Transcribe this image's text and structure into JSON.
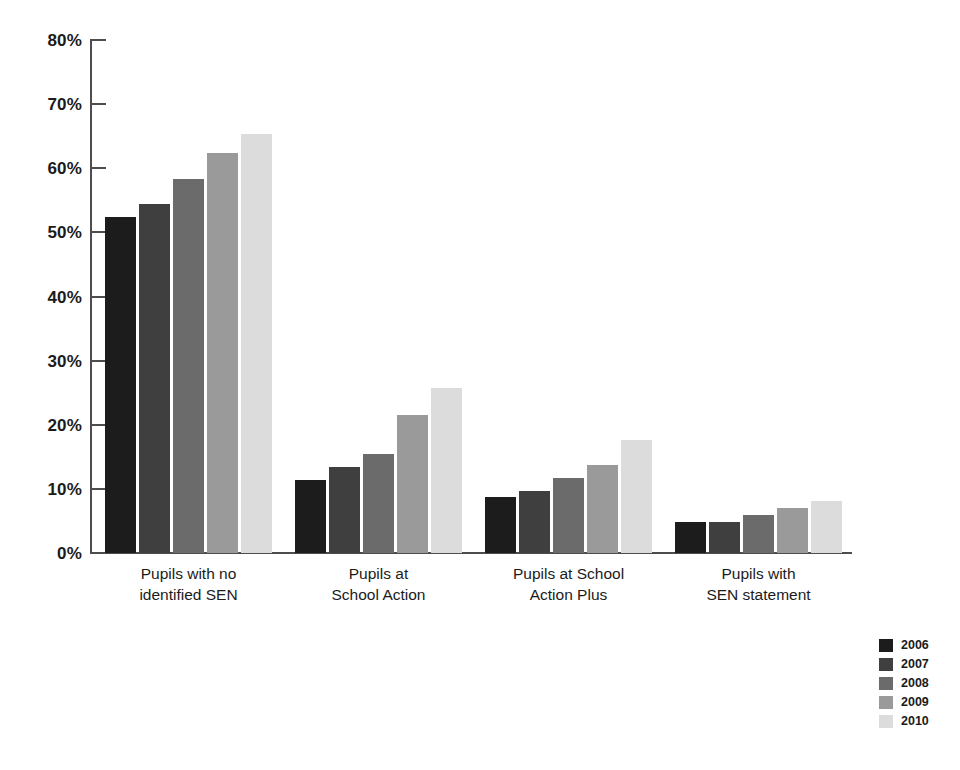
{
  "chart_data": {
    "type": "bar",
    "title": "",
    "subtitle": "",
    "xlabel": "",
    "ylabel": "",
    "ylim": [
      0,
      80
    ],
    "ytick_values": [
      0,
      10,
      20,
      30,
      40,
      50,
      60,
      70,
      80
    ],
    "ytick_labels": [
      "0%",
      "10%",
      "20%",
      "30%",
      "40%",
      "50%",
      "60%",
      "70%",
      "80%"
    ],
    "grid": false,
    "legend_position": "bottom-right",
    "categories": [
      "Pupils with no identified SEN",
      "Pupils at School Action",
      "Pupils at School Action Plus",
      "Pupils with SEN statement"
    ],
    "category_lines": [
      [
        "Pupils with no",
        "identified SEN"
      ],
      [
        "Pupils at",
        "School Action"
      ],
      [
        "Pupils at School",
        "Action Plus"
      ],
      [
        "Pupils with",
        "SEN statement"
      ]
    ],
    "series": [
      {
        "name": "2006",
        "color": "#1c1c1c",
        "values": [
          52.4,
          11.4,
          8.7,
          4.8
        ]
      },
      {
        "name": "2007",
        "color": "#3f3f3f",
        "values": [
          54.4,
          13.4,
          9.7,
          4.8
        ]
      },
      {
        "name": "2008",
        "color": "#6b6b6b",
        "values": [
          58.4,
          15.5,
          11.7,
          6.0
        ]
      },
      {
        "name": "2009",
        "color": "#9a9a9a",
        "values": [
          62.4,
          21.5,
          13.8,
          7.0
        ]
      },
      {
        "name": "2010",
        "color": "#dcdcdc",
        "values": [
          65.4,
          25.7,
          17.7,
          8.1
        ]
      }
    ]
  },
  "legend": {
    "items": [
      {
        "label": "2006",
        "color": "#1c1c1c"
      },
      {
        "label": "2007",
        "color": "#3f3f3f"
      },
      {
        "label": "2008",
        "color": "#6b6b6b"
      },
      {
        "label": "2009",
        "color": "#9a9a9a"
      },
      {
        "label": "2010",
        "color": "#dcdcdc"
      }
    ]
  },
  "axis": {
    "axis_color": "#4d4d4d"
  }
}
